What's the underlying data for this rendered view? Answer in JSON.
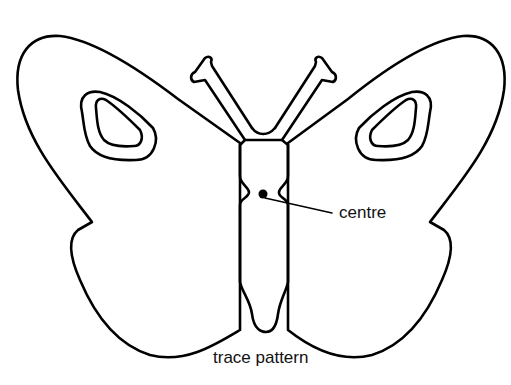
{
  "diagram": {
    "labels": {
      "centre": "centre",
      "caption": "trace pattern"
    },
    "colors": {
      "line": "#000000",
      "background": "#ffffff"
    }
  }
}
